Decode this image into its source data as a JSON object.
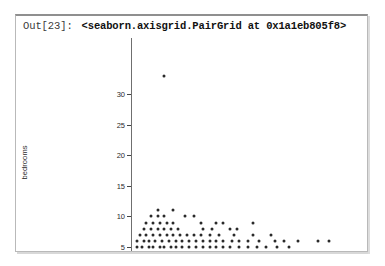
{
  "cell": {
    "prompt": "Out[23]:",
    "repr_text": "<seaborn.axisgrid.PairGrid at 0x1a1eb805f8>"
  },
  "chart_data": {
    "type": "scatter",
    "title": "",
    "xlabel": "",
    "ylabel": "bedrooms",
    "ylim": [
      3,
      34
    ],
    "yticks": [
      5,
      10,
      15,
      20,
      25,
      30
    ],
    "ytick_labels": [
      "5",
      "10",
      "15",
      "20",
      "25",
      "30"
    ],
    "grid": false,
    "legend": null,
    "x_axis_visible_labels": false,
    "marker_color": "#2a2a2a",
    "marker_size_px": 3,
    "note": "x axis tick labels are cropped out of the visible screenshot region",
    "points": [
      {
        "x": 0.13,
        "y": 33
      },
      {
        "x": 0.1,
        "y": 11
      },
      {
        "x": 0.17,
        "y": 11
      },
      {
        "x": 0.07,
        "y": 10
      },
      {
        "x": 0.1,
        "y": 10
      },
      {
        "x": 0.13,
        "y": 10
      },
      {
        "x": 0.22,
        "y": 10
      },
      {
        "x": 0.26,
        "y": 10
      },
      {
        "x": 0.05,
        "y": 9
      },
      {
        "x": 0.08,
        "y": 9
      },
      {
        "x": 0.11,
        "y": 9
      },
      {
        "x": 0.14,
        "y": 9
      },
      {
        "x": 0.17,
        "y": 9
      },
      {
        "x": 0.29,
        "y": 9
      },
      {
        "x": 0.36,
        "y": 9
      },
      {
        "x": 0.39,
        "y": 9
      },
      {
        "x": 0.52,
        "y": 9
      },
      {
        "x": 0.04,
        "y": 8
      },
      {
        "x": 0.07,
        "y": 8
      },
      {
        "x": 0.1,
        "y": 8
      },
      {
        "x": 0.13,
        "y": 8
      },
      {
        "x": 0.16,
        "y": 8
      },
      {
        "x": 0.19,
        "y": 8
      },
      {
        "x": 0.3,
        "y": 8
      },
      {
        "x": 0.34,
        "y": 8
      },
      {
        "x": 0.42,
        "y": 8
      },
      {
        "x": 0.45,
        "y": 8
      },
      {
        "x": 0.02,
        "y": 7
      },
      {
        "x": 0.05,
        "y": 7
      },
      {
        "x": 0.08,
        "y": 7
      },
      {
        "x": 0.11,
        "y": 7
      },
      {
        "x": 0.14,
        "y": 7
      },
      {
        "x": 0.17,
        "y": 7
      },
      {
        "x": 0.2,
        "y": 7
      },
      {
        "x": 0.23,
        "y": 7
      },
      {
        "x": 0.26,
        "y": 7
      },
      {
        "x": 0.29,
        "y": 7
      },
      {
        "x": 0.33,
        "y": 7
      },
      {
        "x": 0.37,
        "y": 7
      },
      {
        "x": 0.44,
        "y": 7
      },
      {
        "x": 0.52,
        "y": 7
      },
      {
        "x": 0.6,
        "y": 7
      },
      {
        "x": 0.01,
        "y": 6
      },
      {
        "x": 0.04,
        "y": 6
      },
      {
        "x": 0.06,
        "y": 6
      },
      {
        "x": 0.09,
        "y": 6
      },
      {
        "x": 0.12,
        "y": 6
      },
      {
        "x": 0.15,
        "y": 6
      },
      {
        "x": 0.18,
        "y": 6
      },
      {
        "x": 0.21,
        "y": 6
      },
      {
        "x": 0.24,
        "y": 6
      },
      {
        "x": 0.27,
        "y": 6
      },
      {
        "x": 0.3,
        "y": 6
      },
      {
        "x": 0.33,
        "y": 6
      },
      {
        "x": 0.36,
        "y": 6
      },
      {
        "x": 0.39,
        "y": 6
      },
      {
        "x": 0.43,
        "y": 6
      },
      {
        "x": 0.46,
        "y": 6
      },
      {
        "x": 0.5,
        "y": 6
      },
      {
        "x": 0.55,
        "y": 6
      },
      {
        "x": 0.62,
        "y": 6
      },
      {
        "x": 0.66,
        "y": 6
      },
      {
        "x": 0.72,
        "y": 6
      },
      {
        "x": 0.81,
        "y": 6
      },
      {
        "x": 0.86,
        "y": 6
      },
      {
        "x": 0.01,
        "y": 5
      },
      {
        "x": 0.03,
        "y": 5
      },
      {
        "x": 0.06,
        "y": 5
      },
      {
        "x": 0.08,
        "y": 5
      },
      {
        "x": 0.11,
        "y": 5
      },
      {
        "x": 0.13,
        "y": 5
      },
      {
        "x": 0.16,
        "y": 5
      },
      {
        "x": 0.18,
        "y": 5
      },
      {
        "x": 0.21,
        "y": 5
      },
      {
        "x": 0.24,
        "y": 5
      },
      {
        "x": 0.27,
        "y": 5
      },
      {
        "x": 0.3,
        "y": 5
      },
      {
        "x": 0.33,
        "y": 5
      },
      {
        "x": 0.36,
        "y": 5
      },
      {
        "x": 0.39,
        "y": 5
      },
      {
        "x": 0.42,
        "y": 5
      },
      {
        "x": 0.46,
        "y": 5
      },
      {
        "x": 0.5,
        "y": 5
      },
      {
        "x": 0.54,
        "y": 5
      },
      {
        "x": 0.58,
        "y": 5
      },
      {
        "x": 0.63,
        "y": 5
      },
      {
        "x": 0.68,
        "y": 5
      },
      {
        "x": 0.01,
        "y": 4
      },
      {
        "x": 0.03,
        "y": 4
      },
      {
        "x": 0.05,
        "y": 4
      },
      {
        "x": 0.08,
        "y": 4
      },
      {
        "x": 0.1,
        "y": 4
      },
      {
        "x": 0.13,
        "y": 4
      },
      {
        "x": 0.15,
        "y": 4
      },
      {
        "x": 0.18,
        "y": 4
      },
      {
        "x": 0.21,
        "y": 4
      },
      {
        "x": 0.23,
        "y": 4
      },
      {
        "x": 0.26,
        "y": 4
      },
      {
        "x": 0.29,
        "y": 4
      },
      {
        "x": 0.33,
        "y": 4
      },
      {
        "x": 0.37,
        "y": 4
      },
      {
        "x": 0.41,
        "y": 4
      },
      {
        "x": 0.45,
        "y": 4
      },
      {
        "x": 0.49,
        "y": 4
      },
      {
        "x": 0.53,
        "y": 4
      },
      {
        "x": 0.02,
        "y": 3
      },
      {
        "x": 0.04,
        "y": 3
      },
      {
        "x": 0.07,
        "y": 3
      },
      {
        "x": 0.09,
        "y": 3
      },
      {
        "x": 0.12,
        "y": 3
      },
      {
        "x": 0.15,
        "y": 3
      },
      {
        "x": 0.18,
        "y": 3
      },
      {
        "x": 0.21,
        "y": 3
      },
      {
        "x": 0.25,
        "y": 3
      },
      {
        "x": 0.29,
        "y": 3
      },
      {
        "x": 0.34,
        "y": 3
      },
      {
        "x": 0.41,
        "y": 3
      }
    ]
  }
}
